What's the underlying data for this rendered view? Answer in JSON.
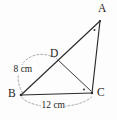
{
  "figure": {
    "kind": "geometry-diagram",
    "stroke_color": "#2b2b2b",
    "dimension_color": "#9a9a9a",
    "background_color": "#fdfdfd"
  },
  "vertices": {
    "a": {
      "label": "A",
      "x": 100,
      "y": 21
    },
    "b": {
      "label": "B",
      "x": 21,
      "y": 95
    },
    "c": {
      "label": "C",
      "x": 92,
      "y": 93
    },
    "d": {
      "label": "D",
      "x": 58,
      "y": 60
    }
  },
  "segments": [
    {
      "name": "side-ab",
      "from": "b",
      "to": "a"
    },
    {
      "name": "side-bc",
      "from": "b",
      "to": "c"
    },
    {
      "name": "side-ca",
      "from": "c",
      "to": "a"
    },
    {
      "name": "cevian-dc",
      "from": "d",
      "to": "c"
    }
  ],
  "angle_marks": [
    {
      "name": "angle-mark-a",
      "at": "a",
      "x": 94,
      "y": 29
    },
    {
      "name": "angle-mark-c",
      "at": "c",
      "x": 84,
      "y": 89
    }
  ],
  "dimensions": [
    {
      "name": "dimension-bd",
      "label": "8 cm",
      "measures": "BD",
      "value": 8,
      "unit": "cm"
    },
    {
      "name": "dimension-bc",
      "label": "12 cm",
      "measures": "BC",
      "value": 12,
      "unit": "cm"
    }
  ]
}
